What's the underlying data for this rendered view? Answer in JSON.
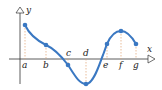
{
  "diagram": {
    "type": "function-graph",
    "axes": {
      "x_label": "x",
      "y_label": "y"
    },
    "curve_color": "#3a78c2",
    "guide_color": "#e0a070",
    "axis_color": "#333333",
    "points": [
      {
        "label": "a",
        "x": 25,
        "y": 25,
        "label_pos": "below"
      },
      {
        "label": "b",
        "x": 46,
        "y": 45,
        "label_pos": "below"
      },
      {
        "label": "c",
        "x": 68,
        "y": 65,
        "label_pos": "above"
      },
      {
        "label": "d",
        "x": 86,
        "y": 84,
        "label_pos": "above"
      },
      {
        "label": "e",
        "x": 107,
        "y": 44,
        "label_pos": "below"
      },
      {
        "label": "f",
        "x": 121,
        "y": 31,
        "label_pos": "below"
      },
      {
        "label": "g",
        "x": 136,
        "y": 44,
        "label_pos": "below"
      }
    ]
  }
}
